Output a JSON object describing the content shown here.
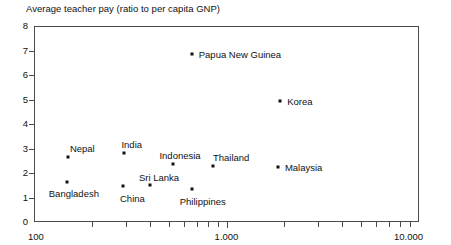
{
  "chart_data": {
    "type": "scatter",
    "title": "Average teacher pay (ratio to per capita GNP)",
    "xlabel": "",
    "ylabel": "",
    "xscale": "log",
    "yscale": "linear",
    "xlim": [
      100,
      10000
    ],
    "ylim": [
      0,
      8
    ],
    "grid": false,
    "legend": "none",
    "yticks": [
      "0",
      "1",
      "2",
      "3",
      "4",
      "5",
      "6",
      "7",
      "8"
    ],
    "xticks": [
      "100",
      "1.000",
      "10.000"
    ],
    "points": [
      {
        "label": "Nepal",
        "x": 150,
        "y": 2.65,
        "label_dx": 2,
        "label_dy": -13
      },
      {
        "label": "Bangladesh",
        "x": 148,
        "y": 1.65,
        "label_dx": -18,
        "label_dy": 7
      },
      {
        "label": "India",
        "x": 295,
        "y": 2.8,
        "label_dx": -3,
        "label_dy": -13
      },
      {
        "label": "China",
        "x": 290,
        "y": 1.45,
        "label_dx": -3,
        "label_dy": 8
      },
      {
        "label": "Sri Lanka",
        "x": 400,
        "y": 1.5,
        "label_dx": -11,
        "label_dy": -12
      },
      {
        "label": "Indonesia",
        "x": 530,
        "y": 2.35,
        "label_dx": -14,
        "label_dy": -13
      },
      {
        "label": "Philippines",
        "x": 660,
        "y": 1.35,
        "label_dx": -12,
        "label_dy": 8
      },
      {
        "label": "Thailand",
        "x": 850,
        "y": 2.3,
        "label_dx": 0,
        "label_dy": -13
      },
      {
        "label": "Papua New Guinea",
        "x": 660,
        "y": 6.85,
        "label_dx": 7,
        "label_dy": -4
      },
      {
        "label": "Korea",
        "x": 1900,
        "y": 4.95,
        "label_dx": 7,
        "label_dy": -4
      },
      {
        "label": "Malaysia",
        "x": 1850,
        "y": 2.25,
        "label_dx": 7,
        "label_dy": -4
      }
    ]
  },
  "axes": {
    "y_values": [
      0,
      1,
      2,
      3,
      4,
      5,
      6,
      7,
      8
    ],
    "x_majors": [
      {
        "value": 100,
        "label": "100",
        "align": "start"
      },
      {
        "value": 1000,
        "label": "1.000",
        "align": "mid"
      },
      {
        "value": 10000,
        "label": "10.000",
        "align": "end"
      }
    ],
    "x_minors": [
      200,
      300,
      400,
      500,
      600,
      700,
      800,
      900,
      2000,
      3000,
      4000,
      5000,
      6000,
      7000,
      8000,
      9000
    ]
  },
  "colors": {
    "axis": "#4a4a4a",
    "text": "#111111",
    "marker": "#111111",
    "background": "#ffffff"
  }
}
